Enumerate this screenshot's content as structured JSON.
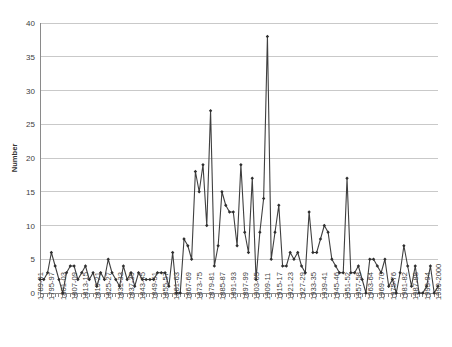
{
  "chart_data": {
    "type": "line",
    "title": "",
    "xlabel": "",
    "ylabel": "Number",
    "ylim": [
      0,
      40
    ],
    "y_ticks": [
      0,
      5,
      10,
      15,
      20,
      25,
      30,
      35,
      40
    ],
    "grid": "horizontal",
    "legend": "none",
    "marker": "diamond",
    "line_color": "#3f3f3f",
    "grid_color": "#c9c9c9",
    "x_tick_labels": [
      "1789-91",
      "1795-97",
      "1801-03",
      "1807-09",
      "1813-15",
      "1819-21",
      "1825-27",
      "1831-33",
      "1837-39",
      "1843-45",
      "1849-51",
      "1855-57",
      "1861-63",
      "1867-69",
      "1873-75",
      "1879-81",
      "1885-87",
      "1891-93",
      "1897-99",
      "1903-05",
      "1909-11",
      "1915-17",
      "1921-23",
      "1927-29",
      "1933-35",
      "1939-41",
      "1945-46",
      "1951-52",
      "1957-58",
      "1963-64",
      "1969-70",
      "1975-76",
      "1981-82",
      "1987-88",
      "1993-94",
      "1999-2000"
    ],
    "x_tick_label_step": 3,
    "categories": [
      "1789-91",
      "1791-93",
      "1793-95",
      "1795-97",
      "1797-99",
      "1799-01",
      "1801-03",
      "1803-05",
      "1805-07",
      "1807-09",
      "1809-11",
      "1811-13",
      "1813-15",
      "1815-17",
      "1817-19",
      "1819-21",
      "1821-23",
      "1823-25",
      "1825-27",
      "1827-29",
      "1829-31",
      "1831-33",
      "1833-35",
      "1835-37",
      "1837-39",
      "1839-41",
      "1841-43",
      "1843-45",
      "1845-47",
      "1847-49",
      "1849-51",
      "1851-53",
      "1853-55",
      "1855-57",
      "1857-59",
      "1859-61",
      "1861-63",
      "1863-65",
      "1865-67",
      "1867-69",
      "1869-71",
      "1871-73",
      "1873-75",
      "1875-77",
      "1877-79",
      "1879-81",
      "1881-83",
      "1883-85",
      "1885-87",
      "1887-89",
      "1889-91",
      "1891-93",
      "1893-95",
      "1895-97",
      "1897-99",
      "1899-01",
      "1901-03",
      "1903-05",
      "1905-07",
      "1907-09",
      "1909-11",
      "1911-13",
      "1913-15",
      "1915-17",
      "1917-19",
      "1919-21",
      "1921-23",
      "1923-25",
      "1925-27",
      "1927-29",
      "1929-31",
      "1931-33",
      "1933-35",
      "1935-37",
      "1937-39",
      "1939-41",
      "1941-43",
      "1943-45",
      "1945-46",
      "1947-48",
      "1949-50",
      "1951-52",
      "1953-54",
      "1955-56",
      "1957-58",
      "1959-60",
      "1961-62",
      "1963-64",
      "1965-66",
      "1967-68",
      "1969-70",
      "1971-72",
      "1973-74",
      "1975-76",
      "1977-78",
      "1979-80",
      "1981-82",
      "1983-84",
      "1985-86",
      "1987-88",
      "1989-90",
      "1991-92",
      "1993-94",
      "1995-96",
      "1997-98",
      "1999-2000"
    ],
    "values": [
      2,
      2,
      3,
      6,
      4,
      2,
      0,
      3,
      4,
      4,
      2,
      3,
      4,
      2,
      3,
      1,
      3,
      2,
      5,
      3,
      2,
      1,
      4,
      2,
      3,
      1,
      3,
      2,
      2,
      2,
      2,
      3,
      3,
      3,
      1,
      6,
      0,
      0,
      8,
      7,
      5,
      18,
      15,
      19,
      10,
      27,
      4,
      7,
      15,
      13,
      12,
      12,
      7,
      19,
      9,
      6,
      17,
      2,
      9,
      14,
      38,
      5,
      9,
      13,
      4,
      4,
      6,
      5,
      6,
      4,
      3,
      12,
      6,
      6,
      8,
      10,
      9,
      5,
      4,
      3,
      3,
      17,
      3,
      3,
      4,
      2,
      0,
      5,
      5,
      4,
      3,
      5,
      1,
      2,
      0,
      3,
      7,
      4,
      1,
      4,
      0,
      0,
      1,
      4,
      0,
      1
    ]
  }
}
